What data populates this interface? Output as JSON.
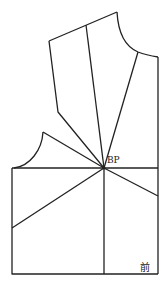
{
  "diagram": {
    "type": "sewing-pattern-bodice-front",
    "labels": {
      "bp": "BP",
      "front": "前"
    },
    "line_color": "#222222",
    "points": {
      "BP": [
        104,
        168
      ]
    }
  }
}
